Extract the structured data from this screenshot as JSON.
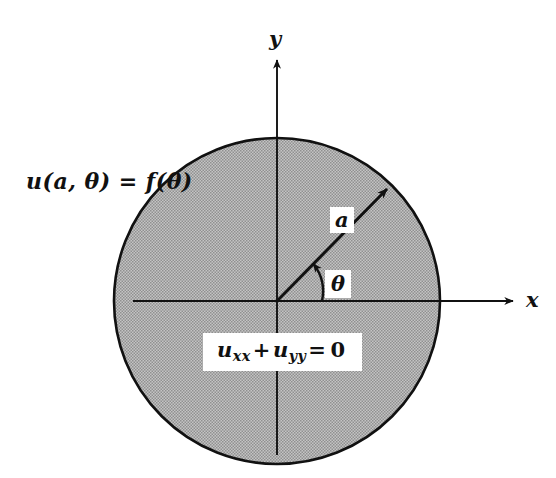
{
  "figure": {
    "background_color": "#ffffff",
    "disk_fill_color": "#b0b0b0",
    "stroke_color": "#111111",
    "center": {
      "x": 277,
      "y": 301
    },
    "radius": 163
  },
  "labels": {
    "boundary_condition": "u(a, θ) = f(θ)",
    "radius": "a",
    "angle": "θ",
    "x_axis": "x",
    "y_axis": "y"
  },
  "equation": {
    "u": "u",
    "sub_xx": "xx",
    "plus": "+",
    "sub_yy": "yy",
    "equals": "=",
    "zero": "0",
    "full_text": "u_xx + u_yy = 0"
  },
  "geometry": {
    "x_axis_from": {
      "x": 133,
      "y": 301
    },
    "x_axis_to": {
      "x": 513,
      "y": 301
    },
    "y_axis_from": {
      "x": 277,
      "y": 455
    },
    "y_axis_to": {
      "x": 277,
      "y": 60
    },
    "radius_arrow_from": {
      "x": 277,
      "y": 301
    },
    "radius_arrow_to": {
      "x": 386,
      "y": 190
    },
    "theta_arc_start": {
      "x": 322,
      "y": 301
    },
    "theta_arc_end": {
      "x": 314,
      "y": 263
    },
    "theta_degrees": 45
  }
}
